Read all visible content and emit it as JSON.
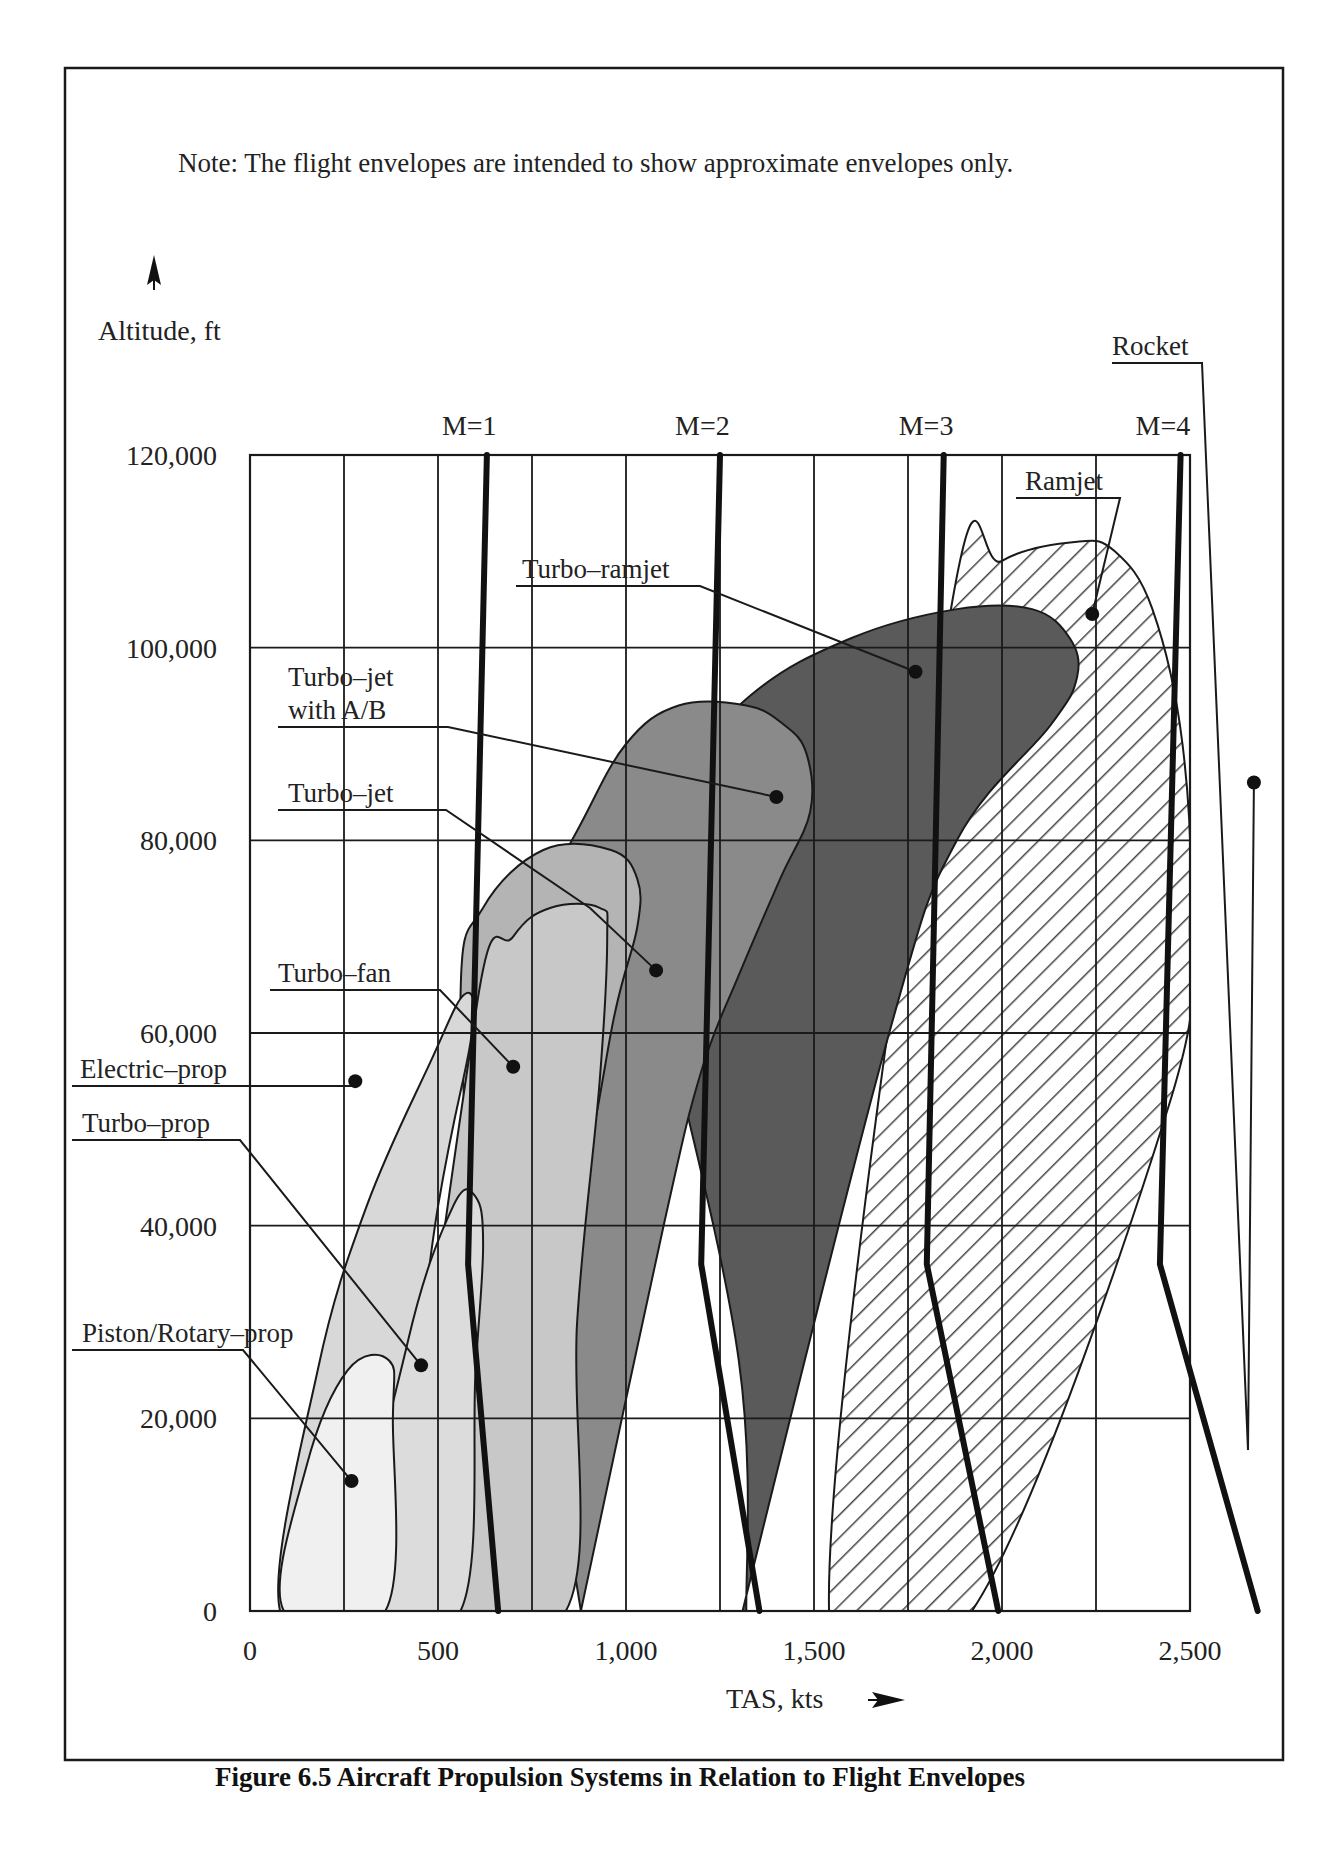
{
  "note": "Note:   The flight envelopes are intended to show approximate envelopes only.",
  "caption": "Figure 6.5 Aircraft Propulsion Systems in Relation to Flight Envelopes",
  "chart_data": {
    "type": "area",
    "title": "Figure 6.5 Aircraft Propulsion Systems in Relation to Flight Envelopes",
    "subtitle": "Note: The flight envelopes are intended to show approximate envelopes only.",
    "xlabel": "TAS, kts",
    "ylabel": "Altitude, ft",
    "xlim": [
      0,
      2500
    ],
    "ylim": [
      0,
      120000
    ],
    "grid": true,
    "x_ticks": [
      0,
      500,
      1000,
      1500,
      2000,
      2500
    ],
    "x_tick_labels": [
      "0",
      "500",
      "1,000",
      "1,500",
      "2,000",
      "2,500"
    ],
    "y_ticks": [
      0,
      20000,
      40000,
      60000,
      80000,
      100000,
      120000
    ],
    "y_tick_labels": [
      "0",
      "20,000",
      "40,000",
      "60,000",
      "80,000",
      "100,000",
      "120,000"
    ],
    "mach_lines": [
      {
        "name": "M=1",
        "points": [
          [
            630,
            120000
          ],
          [
            580,
            36000
          ],
          [
            660,
            0
          ]
        ]
      },
      {
        "name": "M=2",
        "points": [
          [
            1250,
            120000
          ],
          [
            1200,
            36000
          ],
          [
            1355,
            0
          ]
        ]
      },
      {
        "name": "M=3",
        "points": [
          [
            1845,
            120000
          ],
          [
            1800,
            36000
          ],
          [
            1990,
            0
          ]
        ]
      },
      {
        "name": "M=4",
        "points": [
          [
            2475,
            120000
          ],
          [
            2420,
            36000
          ],
          [
            2680,
            0
          ]
        ]
      }
    ],
    "series": [
      {
        "name": "Rocket",
        "fill": "none",
        "marker": [
          2670,
          86000
        ],
        "envelope": []
      },
      {
        "name": "Ramjet",
        "fill": "hatch",
        "envelope": [
          [
            1540,
            0
          ],
          [
            1860,
            103000
          ],
          [
            2000,
            109000
          ],
          [
            2200,
            111000
          ],
          [
            2300,
            110000
          ],
          [
            2400,
            104000
          ],
          [
            2480,
            90000
          ],
          [
            2500,
            72000
          ],
          [
            2440,
            52000
          ],
          [
            1920,
            0
          ]
        ],
        "marker": [
          2240,
          103500
        ]
      },
      {
        "name": "Turbo-ramjet",
        "fill": "#5a5a5a",
        "envelope": [
          [
            1310,
            0
          ],
          [
            1700,
            60000
          ],
          [
            1880,
            80000
          ],
          [
            2130,
            92000
          ],
          [
            2200,
            97000
          ],
          [
            2180,
            101000
          ],
          [
            2080,
            104000
          ],
          [
            1880,
            104000
          ],
          [
            1600,
            101000
          ],
          [
            1330,
            95000
          ],
          [
            1080,
            84000
          ],
          [
            1000,
            78000
          ],
          [
            1100,
            62000
          ],
          [
            1300,
            26000
          ],
          [
            1320,
            0
          ]
        ],
        "marker": [
          1770,
          97500
        ]
      },
      {
        "name": "Turbo-jet with A/B",
        "fill": "#8a8a8a",
        "envelope": [
          [
            880,
            0
          ],
          [
            1100,
            40000
          ],
          [
            1200,
            56000
          ],
          [
            1300,
            66000
          ],
          [
            1410,
            76000
          ],
          [
            1490,
            83000
          ],
          [
            1480,
            89000
          ],
          [
            1420,
            92000
          ],
          [
            1320,
            94000
          ],
          [
            1140,
            94000
          ],
          [
            1000,
            90000
          ],
          [
            870,
            81000
          ],
          [
            720,
            70000
          ],
          [
            660,
            65000
          ],
          [
            720,
            40000
          ],
          [
            880,
            0
          ]
        ],
        "marker": [
          1400,
          84500
        ]
      },
      {
        "name": "Turbo-jet",
        "fill": "#b4b4b4",
        "envelope": [
          [
            600,
            0
          ],
          [
            870,
            42000
          ],
          [
            970,
            62000
          ],
          [
            1030,
            71000
          ],
          [
            1030,
            76000
          ],
          [
            960,
            79000
          ],
          [
            780,
            79000
          ],
          [
            620,
            73000
          ],
          [
            560,
            64000
          ],
          [
            600,
            30000
          ],
          [
            600,
            0
          ]
        ],
        "marker": [
          1080,
          66500
        ]
      },
      {
        "name": "Turbo-fan",
        "fill": "#c8c8c8",
        "envelope": [
          [
            440,
            0
          ],
          [
            600,
            62000
          ],
          [
            700,
            70000
          ],
          [
            800,
            73000
          ],
          [
            930,
            73000
          ],
          [
            950,
            70000
          ],
          [
            930,
            55000
          ],
          [
            870,
            30000
          ],
          [
            840,
            0
          ]
        ],
        "marker": [
          700,
          56500
        ]
      },
      {
        "name": "Electric-prop",
        "fill": "#d8d8d8",
        "envelope": [
          [
            80,
            0
          ],
          [
            180,
            25000
          ],
          [
            310,
            42000
          ],
          [
            480,
            57000
          ],
          [
            570,
            64000
          ],
          [
            590,
            60000
          ],
          [
            500,
            42000
          ],
          [
            330,
            0
          ]
        ],
        "marker": [
          280,
          55000
        ]
      },
      {
        "name": "Turbo-prop",
        "fill": "#dcdcdc",
        "envelope": [
          [
            290,
            0
          ],
          [
            420,
            28000
          ],
          [
            540,
            42000
          ],
          [
            600,
            43000
          ],
          [
            620,
            38000
          ],
          [
            600,
            25000
          ],
          [
            560,
            0
          ]
        ],
        "marker": [
          455,
          25500
        ]
      },
      {
        "name": "Piston/Rotary-prop",
        "fill": "#f0f0f0",
        "envelope": [
          [
            90,
            0
          ],
          [
            150,
            15000
          ],
          [
            260,
            25000
          ],
          [
            370,
            26000
          ],
          [
            380,
            20000
          ],
          [
            360,
            0
          ]
        ],
        "marker": [
          270,
          13500
        ]
      }
    ]
  }
}
